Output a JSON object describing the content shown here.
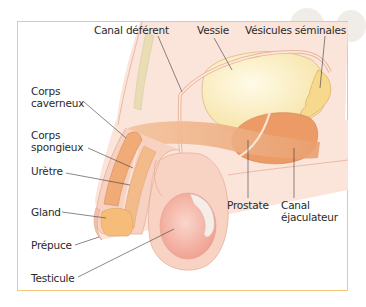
{
  "figure": {
    "title": "",
    "frame_color": "#f2c77a",
    "labels": {
      "canal_deferent": "Canal déférent",
      "vessie": "Vessie",
      "vesicules_seminales": "Vésicules séminales",
      "corps_caverneux_1": "Corps",
      "corps_caverneux_2": "caverneux",
      "corps_spongieux_1": "Corps",
      "corps_spongieux_2": "spongieux",
      "uretre": "Urètre",
      "gland": "Gland",
      "prepuce": "Prépuce",
      "testicule": "Testicule",
      "prostate": "Prostate",
      "canal_ejaculateur_1": "Canal",
      "canal_ejaculateur_2": "éjaculateur"
    },
    "colors": {
      "skin": "#f7d3c2",
      "body_bg": "#fbe9df",
      "bladder": "#f9e9b8",
      "vesicles": "#f7dc95",
      "prostate": "#ec9b68",
      "corpus": "#f0b07a",
      "gland": "#f6c07c",
      "testis": "#f2a99a",
      "bone": "#e6dcb6",
      "line": "#3a3a3a"
    }
  }
}
